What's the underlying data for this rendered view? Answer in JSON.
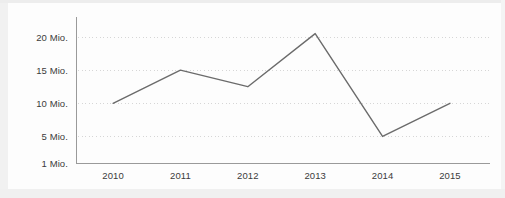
{
  "chart_data": {
    "type": "line",
    "title": "",
    "subtitle": "",
    "xlabel": "",
    "ylabel": "",
    "categories": [
      "2010",
      "2011",
      "2012",
      "2013",
      "2014",
      "2015"
    ],
    "x": [
      2010,
      2011,
      2012,
      2013,
      2014,
      2015
    ],
    "values": [
      10,
      15,
      12.5,
      20.5,
      5,
      10
    ],
    "series": [
      {
        "name": "",
        "values": [
          10,
          15,
          12.5,
          20.5,
          5,
          10
        ]
      }
    ],
    "unit": "Mio.",
    "ytick_values": [
      1,
      5,
      10,
      15,
      20
    ],
    "ytick_labels": [
      "1 Mio.",
      "5 Mio.",
      "10 Mio.",
      "15 Mio.",
      "20 Mio."
    ],
    "xtick_labels": [
      "2010",
      "2011",
      "2012",
      "2013",
      "2014",
      "2015"
    ],
    "ylim": [
      1,
      23
    ],
    "xlim": [
      2009.45,
      2015.55
    ],
    "grid": true,
    "grid_style": "dotted-horizontal",
    "legend": false,
    "legend_position": "none",
    "markers": false,
    "annotations": [],
    "colors": {
      "line": "#6b6b6b",
      "grid": "#d6d6d6",
      "axis": "#9a9a9a",
      "text": "#3b3b3b",
      "background": "#fdfdfd",
      "frame": "#efefef"
    }
  }
}
